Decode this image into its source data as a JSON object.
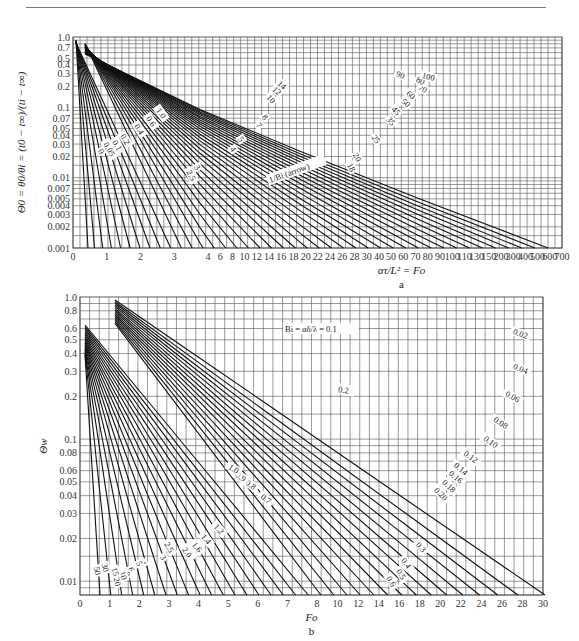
{
  "chart_data": [
    {
      "id": "a",
      "type": "line",
      "caption": "a",
      "title": "",
      "xlabel": "ατ/L² = Fo",
      "ylabel": "Θ0 = θ0/θi = (t0 − t∞)/(ti − t∞)",
      "y_scale": "log",
      "ylim": [
        0.001,
        1.0
      ],
      "y_ticks": [
        "1.0",
        "0.7",
        "0.5",
        "0.4",
        "0.3",
        "0.2",
        "0.1",
        "0.07",
        "0.05",
        "0.04",
        "0.03",
        "0.02",
        "0.01",
        "0.007",
        "0.005",
        "0.004",
        "0.003",
        "0.002",
        "0.001"
      ],
      "x_scale": "piecewise (0–4 linear, 4–30 step 2, 30–100 step 10, 100–150, 150–700)",
      "x_ticks": [
        "0",
        "1",
        "2",
        "3",
        "4",
        "6",
        "8",
        "10",
        "12",
        "14",
        "16",
        "18",
        "20",
        "22",
        "24",
        "26",
        "28",
        "30",
        "40",
        "50",
        "60",
        "70",
        "80",
        "90",
        "100",
        "110",
        "130",
        "150",
        "200",
        "300",
        "400",
        "500",
        "600",
        "700"
      ],
      "grid": true,
      "legend": "curves labeled inline by parameter 1/Bi",
      "series_labels": [
        "0",
        "0.05",
        "0.1",
        "0.2",
        "0.3",
        "0.4",
        "0.5",
        "0.6",
        "0.7",
        "0.8",
        "1.0",
        "1.2",
        "1.4",
        "1.6",
        "1.8",
        "2.0",
        "2.5",
        "3",
        "4",
        "5",
        "6",
        "7",
        "8",
        "9",
        "10",
        "12",
        "14",
        "16",
        "18",
        "20",
        "25",
        "30",
        "35",
        "40",
        "45",
        "50",
        "60",
        "70",
        "80",
        "90",
        "100"
      ],
      "annotations": [
        "1/Bi (arrow)"
      ]
    },
    {
      "id": "b",
      "type": "line",
      "caption": "b",
      "title": "",
      "xlabel": "Fo",
      "ylabel": "Θw",
      "y_scale": "log",
      "ylim": [
        0.008,
        1.0
      ],
      "y_ticks": [
        "1.0",
        "0.8",
        "0.6",
        "0.5",
        "0.4",
        "0.3",
        "0.2",
        "0.1",
        "0.08",
        "0.06",
        "0.05",
        "0.04",
        "0.03",
        "0.02",
        "0.01"
      ],
      "x_scale": "piecewise (0–8 linear, 8–30 step 2)",
      "x_ticks": [
        "0",
        "1",
        "2",
        "3",
        "4",
        "5",
        "6",
        "7",
        "8",
        "10",
        "12",
        "14",
        "16",
        "18",
        "20",
        "22",
        "24",
        "26",
        "28",
        "30"
      ],
      "grid": true,
      "legend": "curves labeled inline by Bi = αδ/λ",
      "series_labels": [
        "0.02",
        "0.04",
        "0.06",
        "0.08",
        "0.10",
        "0.12",
        "0.14",
        "0.16",
        "0.18",
        "0.20",
        "0.3",
        "0.4",
        "0.5",
        "0.6",
        "0.7",
        "0.8",
        "0.9",
        "1.0",
        "1.2",
        "1.4",
        "1.6",
        "1.8",
        "2.0",
        "2.5",
        "3",
        "4",
        "5",
        "6",
        "8",
        "10",
        "15",
        "20",
        "30",
        "50"
      ],
      "annotations": [
        "Bi = αδ/λ = 0.1",
        "0.2"
      ]
    }
  ]
}
